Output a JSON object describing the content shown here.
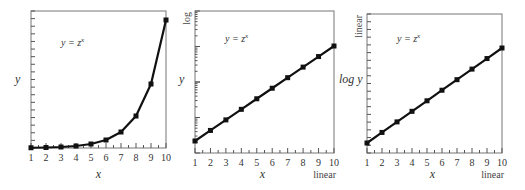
{
  "chart_data": [
    {
      "type": "line",
      "panel": "left",
      "title": "",
      "annotation": "y = z^x",
      "xlabel": "x",
      "ylabel": "y",
      "x_scale": "linear",
      "y_scale": "linear",
      "x": [
        1,
        2,
        3,
        4,
        5,
        6,
        7,
        8,
        9,
        10
      ],
      "series": [
        {
          "name": "y = z^x",
          "values": [
            2,
            4,
            8,
            16,
            32,
            64,
            128,
            256,
            512,
            1024
          ]
        }
      ],
      "xlim": [
        1,
        10
      ],
      "x_tick_labels": [
        "1",
        "2",
        "3",
        "4",
        "5",
        "6",
        "7",
        "8",
        "9",
        "10"
      ],
      "grid": false,
      "markers": "square"
    },
    {
      "type": "line",
      "panel": "middle",
      "title": "",
      "annotation": "y = z^x",
      "xlabel": "x",
      "ylabel": "y",
      "x_scale_label": "linear",
      "y_scale_label": "log",
      "x": [
        1,
        2,
        3,
        4,
        5,
        6,
        7,
        8,
        9,
        10
      ],
      "series": [
        {
          "name": "y = z^x",
          "values": [
            2,
            4,
            8,
            16,
            32,
            64,
            128,
            256,
            512,
            1024
          ]
        }
      ],
      "xlim": [
        1,
        10
      ],
      "x_tick_labels": [
        "1",
        "2",
        "3",
        "4",
        "5",
        "6",
        "7",
        "8",
        "9",
        "10"
      ],
      "grid": false,
      "markers": "square"
    },
    {
      "type": "line",
      "panel": "right",
      "title": "",
      "annotation": "y = z^x",
      "xlabel": "x",
      "ylabel": "log y",
      "x_scale_label": "linear",
      "y_scale_label": "linear",
      "x": [
        1,
        2,
        3,
        4,
        5,
        6,
        7,
        8,
        9,
        10
      ],
      "series": [
        {
          "name": "log y",
          "values": [
            0.301,
            0.602,
            0.903,
            1.204,
            1.505,
            1.806,
            2.107,
            2.408,
            2.709,
            3.01
          ]
        }
      ],
      "xlim": [
        1,
        10
      ],
      "x_tick_labels": [
        "1",
        "2",
        "3",
        "4",
        "5",
        "6",
        "7",
        "8",
        "9",
        "10"
      ],
      "grid": false,
      "markers": "square"
    }
  ],
  "panels": {
    "left": {
      "formula": "y = z",
      "formula_exp": "x",
      "xlabel": "x",
      "ylabel": "y"
    },
    "middle": {
      "formula": "y = z",
      "formula_exp": "x",
      "xlabel": "x",
      "ylabel": "y",
      "y_scale": "log",
      "x_scale": "linear"
    },
    "right": {
      "formula": "y = z",
      "formula_exp": "x",
      "xlabel": "x",
      "ylabel": "log y",
      "y_scale": "linear",
      "x_scale": "linear"
    }
  },
  "x_ticks": [
    "1",
    "2",
    "3",
    "4",
    "5",
    "6",
    "7",
    "8",
    "9",
    "10"
  ]
}
